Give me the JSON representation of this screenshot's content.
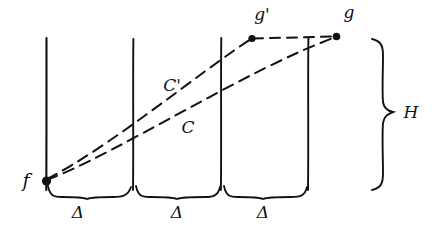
{
  "figure": {
    "style": "hand-drawn pen sketch on white paper",
    "ink_color": "#111111",
    "paper_color": "#ffffff",
    "width": 438,
    "height": 232
  },
  "labels": {
    "point_f": "f",
    "point_g_prime": "g'",
    "point_g": "g",
    "curve_c": "C",
    "curve_c_prime": "C'",
    "height_brace": "H",
    "delta_1": "Δ",
    "delta_2": "Δ",
    "delta_3": "Δ"
  },
  "points": [
    {
      "name": "f",
      "label": "f",
      "x": 46,
      "y": 181
    },
    {
      "name": "g'",
      "label": "g'",
      "x": 252,
      "y": 38
    },
    {
      "name": "g",
      "label": "g",
      "x": 337,
      "y": 36
    }
  ],
  "vertical_lines": [
    {
      "name": "line-1",
      "x": 46,
      "y_top": 38,
      "y_bottom": 190
    },
    {
      "name": "line-2",
      "x": 133,
      "y_top": 39,
      "y_bottom": 190
    },
    {
      "name": "line-3",
      "x": 221,
      "y_top": 38,
      "y_bottom": 190
    },
    {
      "name": "line-4",
      "x": 308,
      "y_top": 38,
      "y_bottom": 190
    }
  ],
  "curves": [
    {
      "name": "C-prime",
      "label": "C'",
      "style": "dashed",
      "description": "path from f up to g' then horizontally right to g",
      "label_x": 172,
      "label_y": 86
    },
    {
      "name": "C",
      "label": "C",
      "style": "dashed",
      "description": "straight dashed path from f directly to g",
      "label_x": 188,
      "label_y": 128
    }
  ],
  "braces": [
    {
      "name": "delta-brace-1",
      "label": "Δ",
      "x_start": 46,
      "x_end": 133,
      "label_x": 78,
      "label_y": 213
    },
    {
      "name": "delta-brace-2",
      "label": "Δ",
      "x_start": 133,
      "x_end": 221,
      "label_x": 177,
      "label_y": 213
    },
    {
      "name": "delta-brace-3",
      "label": "Δ",
      "x_start": 221,
      "x_end": 308,
      "label_x": 263,
      "label_y": 213
    },
    {
      "name": "height-brace",
      "label": "H",
      "y_start": 38,
      "y_end": 190,
      "label_x": 411,
      "label_y": 113
    }
  ]
}
